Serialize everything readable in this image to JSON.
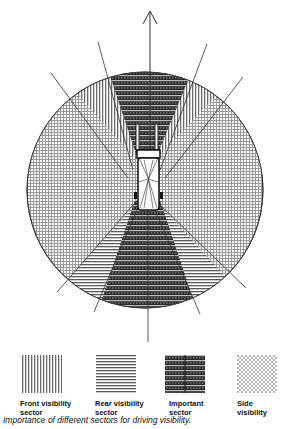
{
  "diagram": {
    "direction_arrow": "forward-arrow",
    "sectors": [
      {
        "id": "front-important",
        "pattern": "important",
        "position": "front-center"
      },
      {
        "id": "front-left",
        "pattern": "front",
        "position": "front-left"
      },
      {
        "id": "front-right",
        "pattern": "front",
        "position": "front-right"
      },
      {
        "id": "side-left",
        "pattern": "side",
        "position": "left"
      },
      {
        "id": "side-right",
        "pattern": "side",
        "position": "right"
      },
      {
        "id": "rear-left",
        "pattern": "rear",
        "position": "rear-left"
      },
      {
        "id": "rear-right",
        "pattern": "rear",
        "position": "rear-right"
      },
      {
        "id": "rear-important",
        "pattern": "important",
        "position": "rear-center"
      }
    ]
  },
  "legend": {
    "items": [
      {
        "pattern": "front",
        "line1": "Front visibility",
        "line2": "sector"
      },
      {
        "pattern": "rear",
        "line1": "Rear visibility",
        "line2": "sector"
      },
      {
        "pattern": "important",
        "line1": "Important",
        "line2": "sector"
      },
      {
        "pattern": "side",
        "line1": "Side",
        "line2": "visibility"
      }
    ]
  },
  "caption": "Importance of different sectors for driving visibility."
}
